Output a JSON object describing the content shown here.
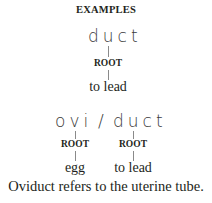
{
  "title": "EXAMPLES",
  "example1": {
    "word": "duct",
    "parts": [
      {
        "label": "ROOT",
        "meaning": "to lead"
      }
    ]
  },
  "example2": {
    "word_part1": "ovi",
    "separator": "/",
    "word_part2": "duct",
    "parts": [
      {
        "label": "ROOT",
        "meaning": "egg"
      },
      {
        "label": "ROOT",
        "meaning": "to lead"
      }
    ]
  },
  "sentence": "Oviduct refers to the uterine tube."
}
